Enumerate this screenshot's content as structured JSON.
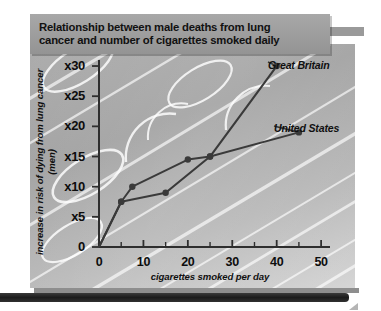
{
  "title": {
    "line1": "Relationship between male deaths from lung",
    "line2": "cancer and number of cigarettes smoked daily"
  },
  "chart_data": {
    "type": "line",
    "title": "Relationship between male deaths from lung cancer and number of cigarettes smoked daily",
    "xlabel": "cigarettes smoked per day",
    "ylabel": "increase in risk of dying from lung cancer (men)",
    "xlim": [
      0,
      52
    ],
    "ylim": [
      0,
      31
    ],
    "xticks": [
      0,
      10,
      20,
      30,
      40,
      50
    ],
    "xtick_labels": [
      "0",
      "10",
      "20",
      "30",
      "40",
      "50"
    ],
    "xminor_step": 5,
    "yticks": [
      0,
      5,
      10,
      15,
      20,
      25,
      30
    ],
    "ytick_labels": [
      "0",
      "x5",
      "x10",
      "x15",
      "x20",
      "x25",
      "x30"
    ],
    "grid": false,
    "legend_position": "inline-end-of-line",
    "marker": "filled-circle",
    "line_color": "#3a3a3a",
    "series": [
      {
        "name": "Great Britain",
        "x": [
          0,
          5,
          15,
          25,
          40
        ],
        "y": [
          0,
          7.5,
          9,
          15,
          30
        ]
      },
      {
        "name": "United States",
        "x": [
          0,
          5,
          7.5,
          20,
          25,
          45
        ],
        "y": [
          0,
          7.5,
          10,
          14.5,
          15,
          19
        ]
      }
    ]
  },
  "axes": {
    "y_tick_labels": [
      "x30",
      "x25",
      "x20",
      "x15",
      "x10",
      "x5",
      "0"
    ],
    "x_tick_labels": [
      "0",
      "10",
      "20",
      "30",
      "40",
      "50"
    ],
    "y_axis_title": "increase in risk of dying from lung cancer (men)",
    "x_axis_title": "cigarettes smoked per day"
  },
  "colors": {
    "panel": "#a8a8a8",
    "banner": "#9d9d9d",
    "line": "#3a3a3a",
    "text": "#101010",
    "deco": "#ffffff",
    "bottom_bar": "#1c1c1c"
  }
}
